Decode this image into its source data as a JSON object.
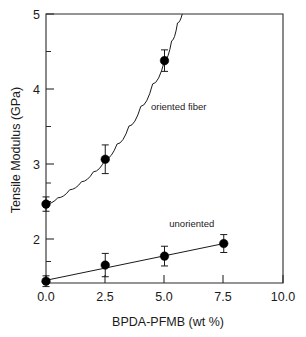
{
  "chart_data": {
    "type": "scatter",
    "title": "",
    "xlabel": "BPDA-PFMB (wt %)",
    "ylabel": "Tensile Modulus  (GPa)",
    "xlim": [
      0.0,
      10.0
    ],
    "ylim": [
      2.0,
      5.0
    ],
    "xticks": [
      0.0,
      2.5,
      5.0,
      7.5,
      10.0
    ],
    "xticklabels": [
      "0.0",
      "2.5",
      "5.0",
      "7.5",
      "10.0"
    ],
    "yticks": [
      2,
      3,
      4,
      5
    ],
    "yticklabels": [
      "2",
      "3",
      "4",
      "5"
    ],
    "yminorticks": [
      2.25,
      2.75,
      3.25,
      3.75,
      4.25,
      4.75
    ],
    "grid": false,
    "legend_position": "inline-annotations",
    "series": [
      {
        "name": "oriented fiber",
        "annotation": "oriented fiber",
        "annotation_x": 5.6,
        "annotation_y": 3.93,
        "marker": "filled-circle",
        "x": [
          0.0,
          2.5,
          5.0
        ],
        "y": [
          2.88,
          3.38,
          4.48
        ],
        "yerr": [
          0.08,
          0.16,
          0.12
        ],
        "fit": "exponential-rise",
        "fit_points": [
          [
            0.0,
            2.88
          ],
          [
            0.5,
            2.95
          ],
          [
            1.0,
            3.04
          ],
          [
            1.5,
            3.13
          ],
          [
            2.0,
            3.24
          ],
          [
            2.5,
            3.38
          ],
          [
            3.0,
            3.55
          ],
          [
            3.5,
            3.75
          ],
          [
            4.0,
            3.97
          ],
          [
            4.5,
            4.22
          ],
          [
            5.0,
            4.48
          ],
          [
            5.3,
            4.7
          ],
          [
            5.55,
            4.9
          ],
          [
            5.75,
            5.0
          ]
        ]
      },
      {
        "name": "unoriented",
        "annotation": "unoriented",
        "annotation_x": 6.15,
        "annotation_y": 2.63,
        "marker": "filled-circle",
        "x": [
          0.0,
          2.5,
          5.0,
          7.5
        ],
        "y": [
          2.02,
          2.2,
          2.3,
          2.44
        ],
        "yerr": [
          0.06,
          0.13,
          0.11,
          0.1
        ],
        "fit": "linear",
        "fit_points": [
          [
            0.0,
            2.03
          ],
          [
            7.5,
            2.44
          ]
        ]
      }
    ]
  },
  "axes": {
    "x_axis_label": "BPDA-PFMB (wt %)",
    "y_axis_label": "Tensile Modulus  (GPa)"
  }
}
